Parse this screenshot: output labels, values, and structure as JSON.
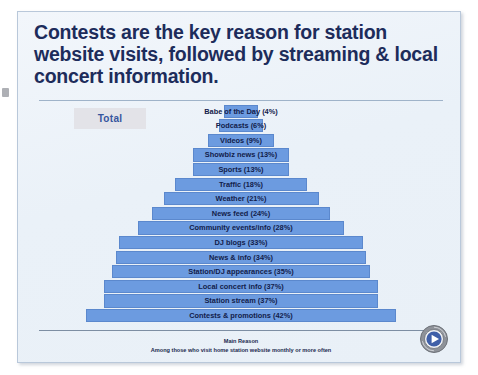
{
  "slide": {
    "title": "Contests are the key reason for station website visits, followed by streaming & local concert information.",
    "segment_label": "Total",
    "footnote_line1": "Main Reason",
    "footnote_line2": "Among those who visit home station website monthly or more often",
    "logo_alt": "computer-play-badge-icon"
  },
  "chart_data": {
    "type": "bar",
    "orientation": "horizontal-pyramid",
    "title": "Contests are the key reason for station website visits, followed by streaming & local concert information.",
    "subtitle": "Main Reason",
    "annotation": "Among those who visit home station website monthly or more often",
    "series_label": "Total",
    "xlabel": "",
    "ylabel": "",
    "xlim": [
      0,
      42
    ],
    "grid": false,
    "legend": "none",
    "value_suffix": "%",
    "categories": [
      "Babe of the Day",
      "Podcasts",
      "Videos",
      "Showbiz news",
      "Sports",
      "Traffic",
      "Weather",
      "News feed",
      "Community events/info",
      "DJ blogs",
      "News & info",
      "Station/DJ appearances",
      "Local concert info",
      "Station stream",
      "Contests & promotions"
    ],
    "values": [
      4,
      6,
      9,
      13,
      13,
      18,
      21,
      24,
      28,
      33,
      34,
      35,
      37,
      37,
      42
    ],
    "bars": [
      {
        "label": "Babe of the Day (4%)",
        "category": "Babe of the Day",
        "value": 4
      },
      {
        "label": "Podcasts (6%)",
        "category": "Podcasts",
        "value": 6
      },
      {
        "label": "Videos (9%)",
        "category": "Videos",
        "value": 9
      },
      {
        "label": "Showbiz news (13%)",
        "category": "Showbiz news",
        "value": 13
      },
      {
        "label": "Sports (13%)",
        "category": "Sports",
        "value": 13
      },
      {
        "label": "Traffic (18%)",
        "category": "Traffic",
        "value": 18
      },
      {
        "label": "Weather (21%)",
        "category": "Weather",
        "value": 21
      },
      {
        "label": "News feed (24%)",
        "category": "News feed",
        "value": 24
      },
      {
        "label": "Community events/info (28%)",
        "category": "Community events/info",
        "value": 28
      },
      {
        "label": "DJ blogs (33%)",
        "category": "DJ blogs",
        "value": 33
      },
      {
        "label": "News & info (34%)",
        "category": "News & info",
        "value": 34
      },
      {
        "label": "Station/DJ appearances (35%)",
        "category": "Station/DJ appearances",
        "value": 35
      },
      {
        "label": "Local concert info (37%)",
        "category": "Local concert info",
        "value": 37
      },
      {
        "label": "Station stream (37%)",
        "category": "Station stream",
        "value": 37
      },
      {
        "label": "Contests & promotions (42%)",
        "category": "Contests & promotions",
        "value": 42
      }
    ],
    "colors": {
      "bar_fill": "#6c9be0",
      "bar_stroke": "#5b88cd",
      "title_text": "#1d2c5b",
      "label_text": "#12204a",
      "background": "#eaf1f8",
      "accent": "#35569e"
    }
  }
}
